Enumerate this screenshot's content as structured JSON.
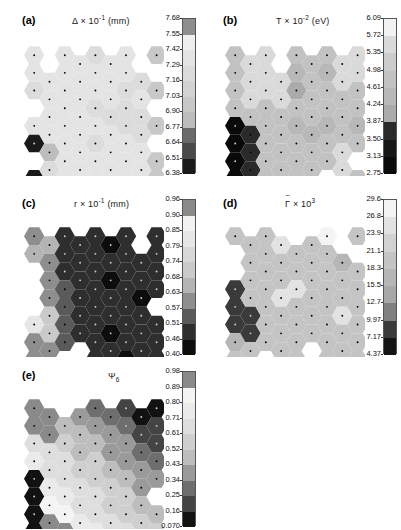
{
  "figure": {
    "width": 401,
    "height": 530,
    "background": "#ffffff"
  },
  "chart_data": {
    "type": "heatmap",
    "layout": "5 panels: (a) and (b) top row, (c) and (d) middle row, (e) bottom-left",
    "grid_geometry": {
      "cell_shape": "flat-top hexagon",
      "arrangement": "honeycomb, approx 9 columns x 8 rows, ragged boundary",
      "marker": "small black dot at each hexagon center",
      "colormap": "discrete grayscale, light = high value, dark = low value"
    },
    "panels": [
      {
        "id": "a",
        "label": "(a)",
        "title_main": "Δ",
        "title_times": "×",
        "title_mantissa": "10",
        "title_exponent": "-1",
        "title_units": "(mm)",
        "title_plain": "Δ × 10⁻¹ (mm)",
        "colorbar": {
          "ticks": [
            "7.68",
            "7.55",
            "7.42",
            "7.29",
            "7.16",
            "7.03",
            "6.90",
            "6.77",
            "6.64",
            "6.51",
            "6.38"
          ],
          "vmax": 7.68,
          "vmin": 6.38,
          "n_levels": 10,
          "level_grays": [
            "#8e8e8e",
            "#efefef",
            "#e4e4e4",
            "#dcdcdc",
            "#d2d2d2",
            "#c8c8c8",
            "#bdbdbd",
            "#6a6a6a",
            "#4a4a4a",
            "#1a1a1a"
          ]
        },
        "field_summary": "mostly uniform light gray near 7.0-7.2; darker gray column along right edge; one black cell and one medium gray cell at lower-left corner"
      },
      {
        "id": "b",
        "label": "(b)",
        "title_main": "T",
        "title_times": "×",
        "title_mantissa": "10",
        "title_exponent": "-2",
        "title_units": "(eV)",
        "title_plain": "T × 10⁻² (eV)",
        "colorbar": {
          "ticks": [
            "6.09",
            "5.72",
            "5.35",
            "4.98",
            "4.61",
            "4.24",
            "3.87",
            "3.50",
            "3.13",
            "2.75"
          ],
          "vmax": 6.09,
          "vmin": 2.75,
          "n_levels": 9,
          "level_grays": [
            "#f2f2f2",
            "#dadada",
            "#cccccc",
            "#c2c2c2",
            "#b8b8b8",
            "#ababab",
            "#2a2a2a",
            "#161616",
            "#0a0a0a"
          ]
        },
        "field_summary": "mid-gray field near 4.2-4.6; bright cluster of light cells upper-left-center; one darker hexagon top-center-right; bright cell at right edge; black cluster lower-left corner"
      },
      {
        "id": "c",
        "label": "(c)",
        "title_main": "r",
        "title_times": "×",
        "title_mantissa": "10",
        "title_exponent": "-1",
        "title_units": "(mm)",
        "title_plain": "r × 10⁻¹ (mm)",
        "colorbar": {
          "ticks": [
            "0.96",
            "0.90",
            "0.85",
            "0.79",
            "0.74",
            "0.68",
            "0.63",
            "0.57",
            "0.51",
            "0.46",
            "0.40"
          ],
          "vmax": 0.96,
          "vmin": 0.4,
          "n_levels": 10,
          "level_grays": [
            "#8a8a8a",
            "#f2f2f2",
            "#e6e6e6",
            "#d8d8d8",
            "#cacaca",
            "#b4b4b4",
            "#8e8e8e",
            "#5a5a5a",
            "#2e2e2e",
            "#0d0d0d"
          ]
        },
        "field_summary": "overwhelmingly very dark (near 0.40-0.50) across right two-thirds; lighter gray cells along left edge; brightest light-gray cluster at middle-left"
      },
      {
        "id": "d",
        "label": "(d)",
        "title_main": "Γ",
        "title_tilde": true,
        "title_times": "×",
        "title_mantissa": "10",
        "title_exponent": "3",
        "title_units": "",
        "title_plain": "Γ̃ × 10³",
        "colorbar": {
          "ticks": [
            "29.6",
            "26.8",
            "23.9",
            "21.1",
            "18.3",
            "15.5",
            "12.7",
            "9.97",
            "7.17",
            "4.37"
          ],
          "vmax": 29.6,
          "vmin": 4.37,
          "n_levels": 9,
          "level_grays": [
            "#f4f4f4",
            "#e2e2e2",
            "#d2d2d2",
            "#c4c4c4",
            "#b6b6b6",
            "#a8a8a8",
            "#808080",
            "#3a3a3a",
            "#141414"
          ]
        },
        "field_summary": "uniform mid-gray near 15-20; scattered bright cells top-center, center and right; dark cluster of three cells at left edge"
      },
      {
        "id": "e",
        "label": "(e)",
        "title_main": "Ψ",
        "title_sub": "6",
        "title_times": "",
        "title_mantissa": "",
        "title_exponent": "",
        "title_units": "",
        "title_plain": "Ψ₆"
      }
    ],
    "panel_e_colorbar": {
      "ticks": [
        "0.98",
        "0.89",
        "0.80",
        "0.71",
        "0.61",
        "0.52",
        "0.43",
        "0.34",
        "0.25",
        "0.16",
        "0.070"
      ],
      "vmax": 0.98,
      "vmin": 0.07,
      "n_levels": 10,
      "level_grays": [
        "#8a8a8a",
        "#f4f4f4",
        "#eaeaea",
        "#dedede",
        "#cfcfcf",
        "#bdbdbd",
        "#9a9a9a",
        "#6e6e6e",
        "#444444",
        "#121212"
      ]
    },
    "panel_e_field_summary": "strong diagonal split: dark gray high-order region upper-right (approx 0.40-0.50), bright low-order band lower-left (approx 0.80-0.95), black cells at far left corner"
  }
}
